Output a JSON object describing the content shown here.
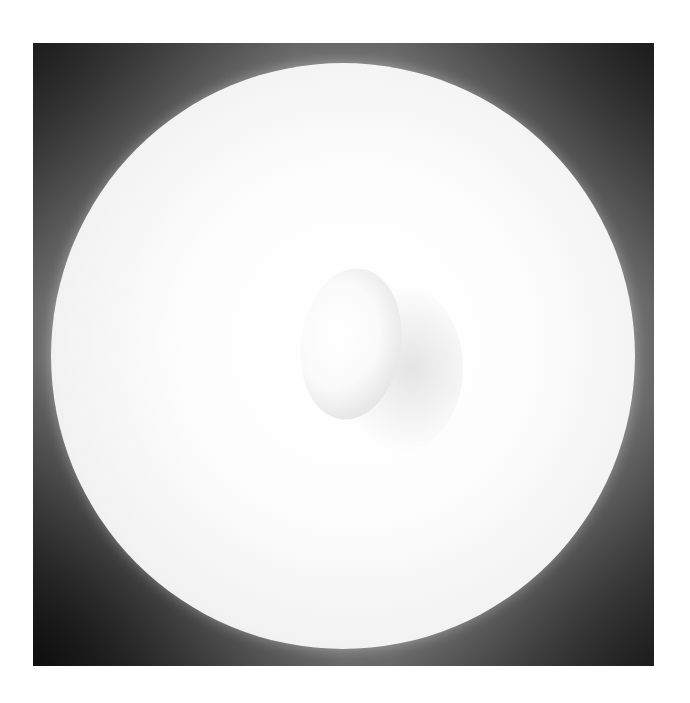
{
  "image": {
    "description": "Black-and-white photograph of a large white disc on a dark mottled background with an egg-shaped object near its center",
    "colors": {
      "page_background": "#ffffff",
      "disc": "#f7f7f7",
      "background_mid": "#8a8a8a",
      "background_dark": "#2a2a2a",
      "egg": "#f0f0f0"
    }
  }
}
